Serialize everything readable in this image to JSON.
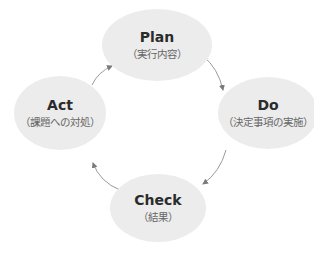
{
  "diagram": {
    "type": "cycle",
    "nodes": [
      {
        "id": "plan",
        "title": "Plan",
        "subtitle": "（実行内容）"
      },
      {
        "id": "do",
        "title": "Do",
        "subtitle": "（決定事項の実施）"
      },
      {
        "id": "check",
        "title": "Check",
        "subtitle": "（結果）"
      },
      {
        "id": "act",
        "title": "Act",
        "subtitle": "（課題への対処）"
      }
    ],
    "edges": [
      {
        "from": "plan",
        "to": "do"
      },
      {
        "from": "do",
        "to": "check"
      },
      {
        "from": "check",
        "to": "act"
      },
      {
        "from": "act",
        "to": "plan"
      }
    ],
    "colors": {
      "node_fill": "#ececec",
      "arrow": "#8a8a8a",
      "title": "#2b2b2b",
      "subtitle": "#666666"
    }
  }
}
